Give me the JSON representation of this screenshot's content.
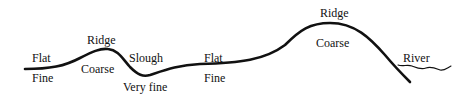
{
  "diagram": {
    "type": "terrain-cross-section",
    "line_color": "#111111",
    "landforms": [
      {
        "id": "flat-1",
        "name": "Flat",
        "sediment": "Fine"
      },
      {
        "id": "ridge-1",
        "name": "Ridge",
        "sediment": "Coarse"
      },
      {
        "id": "slough",
        "name": "Slough",
        "sediment": "Very fine"
      },
      {
        "id": "flat-2",
        "name": "Flat",
        "sediment": "Fine"
      },
      {
        "id": "ridge-2",
        "name": "Ridge",
        "sediment": "Coarse"
      },
      {
        "id": "river",
        "name": "River"
      }
    ]
  }
}
